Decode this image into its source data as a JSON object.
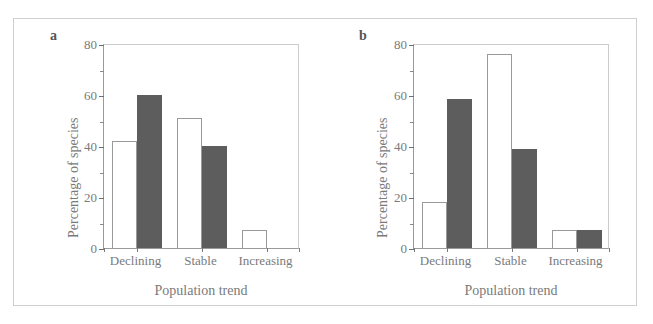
{
  "figure": {
    "panels": [
      {
        "id": "a",
        "label": "a",
        "ylabel": "Percentage of species",
        "xlabel": "Population trend"
      },
      {
        "id": "b",
        "label": "b",
        "ylabel": "Percentage of species",
        "xlabel": "Population trend"
      }
    ],
    "colors": {
      "open_bar_fill": "#ffffff",
      "open_bar_stroke": "#9a9a9a",
      "filled_bar": "#5d5d5d",
      "axis": "#9b9b9b",
      "text": "#7a7a7a",
      "figure_border": "#cfcfcf"
    }
  },
  "chart_data": [
    {
      "type": "bar",
      "panel": "a",
      "title": "a",
      "categories": [
        "Declining",
        "Stable",
        "Increasing"
      ],
      "series": [
        {
          "name": "open",
          "values": [
            42,
            51,
            7
          ]
        },
        {
          "name": "filled",
          "values": [
            60,
            40,
            0
          ]
        }
      ],
      "xlabel": "Population trend",
      "ylabel": "Percentage of species",
      "ylim": [
        0,
        80
      ],
      "yticks": [
        0,
        20,
        40,
        60,
        80
      ],
      "yticklabels": [
        "0",
        "20",
        "40",
        "60",
        "80"
      ],
      "yminorticks": [
        10,
        30,
        50,
        70
      ],
      "grid": false,
      "legend": null
    },
    {
      "type": "bar",
      "panel": "b",
      "title": "b",
      "categories": [
        "Declining",
        "Stable",
        "Increasing"
      ],
      "series": [
        {
          "name": "open",
          "values": [
            18,
            76,
            7
          ]
        },
        {
          "name": "filled",
          "values": [
            58.5,
            39,
            7
          ]
        }
      ],
      "xlabel": "Population trend",
      "ylabel": "Percentage of species",
      "ylim": [
        0,
        80
      ],
      "yticks": [
        0,
        20,
        40,
        60,
        80
      ],
      "yticklabels": [
        "0",
        "20",
        "40",
        "60",
        "80"
      ],
      "yminorticks": [
        10,
        30,
        50,
        70
      ],
      "grid": false,
      "legend": null
    }
  ]
}
